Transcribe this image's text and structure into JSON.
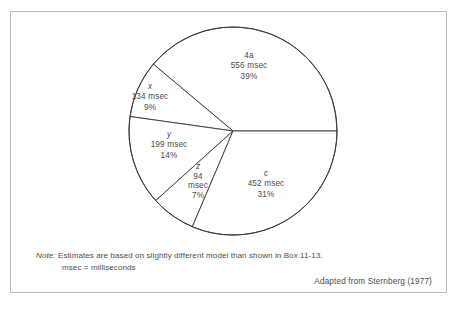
{
  "figure": {
    "top_bleed_left": "· · ·",
    "top_bleed_right": "· ·",
    "frame_color": "#b9b9b9",
    "ink_color": "#3a3a3a"
  },
  "chart_data": {
    "type": "pie",
    "title": "",
    "subtitle": "",
    "xlabel": "",
    "ylabel": "",
    "legend_position": "inside-slices",
    "grid": false,
    "units": "msec",
    "total_msec": 1435,
    "center_px": [
      232,
      130
    ],
    "radius_px": 104,
    "start_angle_deg": 0,
    "direction": "counterclockwise",
    "categories": [
      "4a",
      "x",
      "y",
      "z",
      "c"
    ],
    "values": [
      556,
      134,
      199,
      94,
      452
    ],
    "percents": [
      39,
      9,
      14,
      7,
      31
    ],
    "slices": [
      {
        "key": "4a",
        "symbol": "4a",
        "symbol_italic": false,
        "value": 556,
        "value_label": "556 msec",
        "percent": 39,
        "percent_label": "39%",
        "start_deg": 0,
        "end_deg": 140,
        "fill": "#ffffff",
        "stroke": "#3a3a3a"
      },
      {
        "key": "x",
        "symbol": "x",
        "symbol_italic": true,
        "value": 134,
        "value_label": "134 msec",
        "percent": 9,
        "percent_label": "9%",
        "start_deg": 140,
        "end_deg": 172,
        "fill": "#ffffff",
        "stroke": "#3a3a3a"
      },
      {
        "key": "y",
        "symbol": "y",
        "symbol_italic": true,
        "value": 199,
        "value_label": "199 msec",
        "percent": 14,
        "percent_label": "14%",
        "start_deg": 172,
        "end_deg": 222,
        "fill": "#ffffff",
        "stroke": "#3a3a3a"
      },
      {
        "key": "z",
        "symbol": "z",
        "symbol_italic": true,
        "value": 94,
        "value_label_line1": "94",
        "value_label_line2": "msec",
        "value_label": "94 msec",
        "percent": 7,
        "percent_label": "7%",
        "start_deg": 222,
        "end_deg": 247,
        "fill": "#ffffff",
        "stroke": "#3a3a3a"
      },
      {
        "key": "c",
        "symbol": "c",
        "symbol_italic": true,
        "value": 452,
        "value_label": "452 msec",
        "percent": 31,
        "percent_label": "31%",
        "start_deg": 247,
        "end_deg": 360,
        "fill": "#ffffff",
        "stroke": "#3a3a3a"
      }
    ]
  },
  "note": {
    "label": "Note:",
    "line1": "Estimates are based on slightly different model than shown in Box 11-13.",
    "line2": "msec = milliseconds"
  },
  "source": {
    "text": "Adapted from Sternberg (1977)"
  }
}
